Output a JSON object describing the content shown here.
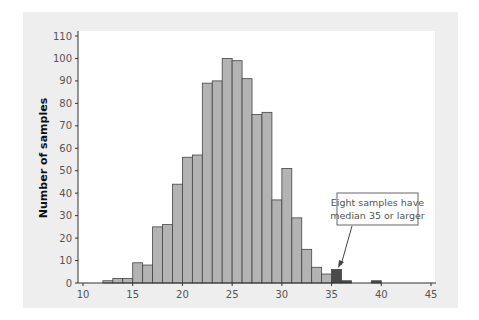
{
  "chart_data": {
    "type": "bar",
    "title": "",
    "xlabel": "",
    "ylabel": "Number of samples",
    "xlim": [
      10,
      45
    ],
    "ylim": [
      0,
      110
    ],
    "x_ticks": [
      10,
      15,
      20,
      25,
      30,
      35,
      40,
      45
    ],
    "y_ticks": [
      0,
      10,
      20,
      30,
      40,
      50,
      60,
      70,
      80,
      90,
      100,
      110
    ],
    "bin_width": 1,
    "bins": [
      12,
      13,
      14,
      15,
      16,
      17,
      18,
      19,
      20,
      21,
      22,
      23,
      24,
      25,
      26,
      27,
      28,
      29,
      30,
      31,
      32,
      33,
      34,
      35,
      36,
      37,
      38,
      39
    ],
    "values": [
      1,
      2,
      2,
      9,
      8,
      25,
      26,
      44,
      56,
      57,
      89,
      90,
      100,
      99,
      91,
      75,
      76,
      37,
      51,
      29,
      15,
      7,
      4,
      6,
      1,
      0,
      0,
      1
    ],
    "highlight_from": 35,
    "colors": {
      "bar": "#b3b3b3",
      "highlight": "#4a4a4a",
      "edge": "#444444",
      "panel": "#eeeeee",
      "plot": "#ffffff"
    },
    "grid": false,
    "annotation": {
      "lines": [
        "Eight samples have",
        "median 35 or larger"
      ],
      "points_to_x": 35.5,
      "points_to_y": 7
    }
  }
}
